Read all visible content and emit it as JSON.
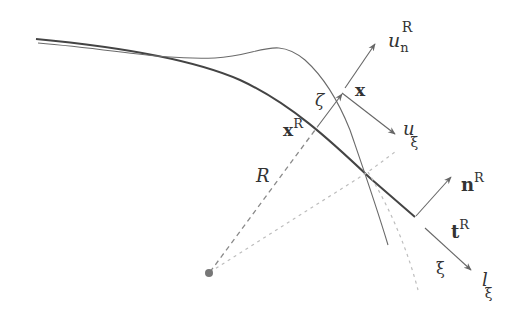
{
  "diagram": {
    "title": "",
    "colors": {
      "background": "#ffffff",
      "thick_curve": "#444444",
      "thin_curve": "#6a6a6a",
      "arrows": "#666666",
      "dashed": "#8a8a8a",
      "dotted_light": "#bdbdbd",
      "origin_dot": "#777777"
    },
    "labels": {
      "u_n": {
        "base": "u",
        "sub": "n",
        "sup": "R"
      },
      "x": {
        "base": "x"
      },
      "zeta": {
        "base": "ζ"
      },
      "xR": {
        "base": "x",
        "sup": "R"
      },
      "u_xi": {
        "base": "u",
        "sub": "ξ"
      },
      "R": {
        "base": "R"
      },
      "nR": {
        "base": "n",
        "sup": "R"
      },
      "tR": {
        "base": "t",
        "sup": "R"
      },
      "xi": {
        "base": "ξ"
      },
      "l_xi": {
        "base": "l",
        "sub": "ξ"
      }
    }
  }
}
